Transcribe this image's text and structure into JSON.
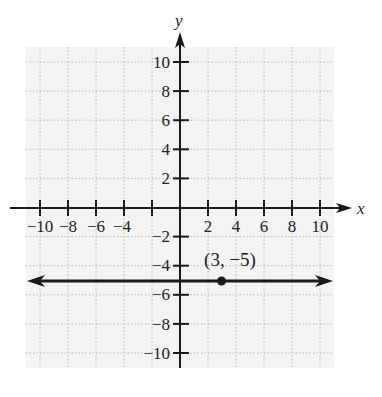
{
  "chart_data": {
    "type": "line",
    "title": "",
    "xlabel": "x",
    "ylabel": "y",
    "xlim": [
      -11,
      11
    ],
    "ylim": [
      -11,
      11
    ],
    "grid": true,
    "x_ticks": [
      -10,
      -8,
      -6,
      -4,
      -2,
      2,
      4,
      6,
      8,
      10
    ],
    "x_tick_labels": [
      "-10",
      "-8",
      "-6",
      "-4",
      "",
      "2",
      "4",
      "6",
      "8",
      "10"
    ],
    "y_ticks": [
      10,
      8,
      6,
      4,
      2,
      -2,
      -4,
      -6,
      -8,
      -10
    ],
    "y_tick_labels": [
      "10",
      "8",
      "6",
      "4",
      "2",
      "-2",
      "-4",
      "-6",
      "-8",
      "-10"
    ],
    "series": [
      {
        "name": "y = -5",
        "type": "horizontal-line",
        "y": -5,
        "x_range": [
          -11,
          11
        ],
        "arrows": "both"
      }
    ],
    "points": [
      {
        "x": 3,
        "y": -5,
        "label": "(3, −5)"
      }
    ]
  },
  "labels": {
    "x_axis": "x",
    "y_axis": "y",
    "point": "(3, −5)",
    "x_ticks": [
      "−10",
      "−8",
      "−6",
      "−4",
      "2",
      "4",
      "6",
      "8",
      "10"
    ],
    "y_ticks": [
      "10",
      "8",
      "6",
      "4",
      "2",
      "−2",
      "−4",
      "−6",
      "−8",
      "−10"
    ]
  },
  "colors": {
    "grid_bg": "#f3f3f3",
    "grid_line": "#b8b8b8",
    "ink": "#1a1a1a"
  }
}
